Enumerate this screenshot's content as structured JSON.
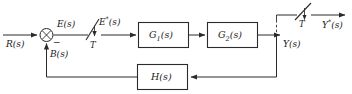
{
  "diagram": {
    "kind": "block-diagram",
    "width": 352,
    "height": 94,
    "background": "#ffffff",
    "line_color": "#2b2b2b",
    "text_color": "#1a1a1a"
  },
  "signals": {
    "input": "R(s)",
    "error": "E(s)",
    "sampled_error_base": "E",
    "sampled_error_star": "*",
    "sampled_error_tail": "(s)",
    "feedback": "B(s)",
    "output": "Y(s)",
    "sampled_output_base": "Y",
    "sampled_output_star": "*",
    "sampled_output_tail": "(s)",
    "minus_sign": "−"
  },
  "blocks": [
    {
      "id": "g1",
      "base": "G",
      "sub": "1",
      "tail": "(s)",
      "label": "G1(s)"
    },
    {
      "id": "g2",
      "base": "G",
      "sub": "2",
      "tail": "(s)",
      "label": "G2(s)"
    },
    {
      "id": "h",
      "base": "H",
      "sub": "",
      "tail": "(s)",
      "label": "H(s)"
    }
  ],
  "samplers": [
    {
      "id": "input-sampler",
      "period_label": "T"
    },
    {
      "id": "output-sampler",
      "period_label": "T"
    }
  ],
  "junction": {
    "id": "summing-junction",
    "glyph": "x",
    "positive_input": "R(s)",
    "negative_input": "B(s)",
    "output": "E(s)"
  }
}
